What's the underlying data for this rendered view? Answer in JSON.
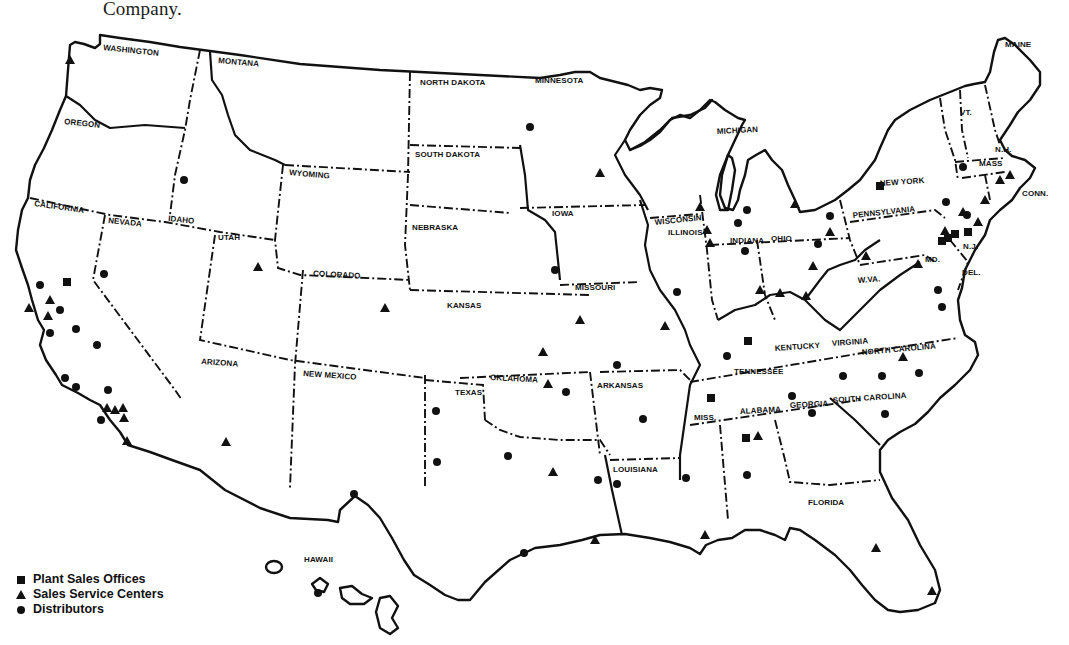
{
  "caption": {
    "text": "Company."
  },
  "map": {
    "state_labels": [
      {
        "name": "WASHINGTON",
        "x": 103,
        "y": 50,
        "r": 6
      },
      {
        "name": "MONTANA",
        "x": 218,
        "y": 63,
        "r": 5
      },
      {
        "name": "OREGON",
        "x": 64,
        "y": 124,
        "r": 6
      },
      {
        "name": "IDAHO",
        "x": 168,
        "y": 221,
        "r": 6
      },
      {
        "name": "WYOMING",
        "x": 289,
        "y": 175,
        "r": 5
      },
      {
        "name": "CALIFORNIA",
        "x": 34,
        "y": 206,
        "r": 8
      },
      {
        "name": "NEVADA",
        "x": 108,
        "y": 223,
        "r": 6
      },
      {
        "name": "UTAH",
        "x": 218,
        "y": 240,
        "r": 0
      },
      {
        "name": "COLORADO",
        "x": 313,
        "y": 276,
        "r": 3
      },
      {
        "name": "ARIZONA",
        "x": 201,
        "y": 364,
        "r": 4
      },
      {
        "name": "NEW MEXICO",
        "x": 303,
        "y": 376,
        "r": 4
      },
      {
        "name": "NORTH DAKOTA",
        "x": 420,
        "y": 85,
        "r": 0
      },
      {
        "name": "SOUTH DAKOTA",
        "x": 415,
        "y": 157,
        "r": 0
      },
      {
        "name": "NEBRASKA",
        "x": 412,
        "y": 230,
        "r": 0
      },
      {
        "name": "KANSAS",
        "x": 447,
        "y": 308,
        "r": 0
      },
      {
        "name": "OKLAHOMA",
        "x": 490,
        "y": 380,
        "r": 3
      },
      {
        "name": "TEXAS",
        "x": 455,
        "y": 395,
        "r": 0
      },
      {
        "name": "MINNESOTA",
        "x": 535,
        "y": 83,
        "r": 0
      },
      {
        "name": "IOWA",
        "x": 552,
        "y": 216,
        "r": 0
      },
      {
        "name": "MISSOURI",
        "x": 575,
        "y": 290,
        "r": 0
      },
      {
        "name": "ARKANSAS",
        "x": 597,
        "y": 388,
        "r": 0
      },
      {
        "name": "LOUISIANA",
        "x": 613,
        "y": 472,
        "r": 0
      },
      {
        "name": "WISCONSIN",
        "x": 655,
        "y": 225,
        "r": -6
      },
      {
        "name": "ILLINOIS",
        "x": 668,
        "y": 235,
        "r": 0
      },
      {
        "name": "MICHIGAN",
        "x": 717,
        "y": 134,
        "r": -3
      },
      {
        "name": "INDIANA",
        "x": 730,
        "y": 243,
        "r": 0
      },
      {
        "name": "OHIO",
        "x": 771,
        "y": 241,
        "r": 0
      },
      {
        "name": "KENTUCKY",
        "x": 775,
        "y": 351,
        "r": -4
      },
      {
        "name": "TENNESSEE",
        "x": 734,
        "y": 374,
        "r": 0
      },
      {
        "name": "MISS.",
        "x": 694,
        "y": 420,
        "r": 0
      },
      {
        "name": "ALABAMA",
        "x": 740,
        "y": 414,
        "r": -3
      },
      {
        "name": "GEORGIA",
        "x": 790,
        "y": 408,
        "r": -3
      },
      {
        "name": "FLORIDA",
        "x": 808,
        "y": 505,
        "r": 0
      },
      {
        "name": "SOUTH CAROLINA",
        "x": 833,
        "y": 403,
        "r": -4
      },
      {
        "name": "NORTH CAROLINA",
        "x": 862,
        "y": 355,
        "r": -5
      },
      {
        "name": "VIRGINIA",
        "x": 832,
        "y": 346,
        "r": -4
      },
      {
        "name": "W.VA.",
        "x": 858,
        "y": 283,
        "r": -4
      },
      {
        "name": "MD.",
        "x": 925,
        "y": 262,
        "r": 0
      },
      {
        "name": "DEL.",
        "x": 962,
        "y": 275,
        "r": 0
      },
      {
        "name": "N.J.",
        "x": 963,
        "y": 249,
        "r": 0
      },
      {
        "name": "PENNSYLVANIA",
        "x": 853,
        "y": 218,
        "r": -6
      },
      {
        "name": "NEW YORK",
        "x": 880,
        "y": 186,
        "r": -4
      },
      {
        "name": "CONN.",
        "x": 1022,
        "y": 196,
        "r": 0
      },
      {
        "name": "MASS",
        "x": 979,
        "y": 166,
        "r": 0
      },
      {
        "name": "N.H.",
        "x": 995,
        "y": 152,
        "r": 0
      },
      {
        "name": "VT.",
        "x": 960,
        "y": 115,
        "r": 0
      },
      {
        "name": "MAINE",
        "x": 1005,
        "y": 47,
        "r": 0
      },
      {
        "name": "HAWAII",
        "x": 304,
        "y": 562,
        "r": 0
      }
    ],
    "markers": {
      "plant_sales_offices": [
        [
          67,
          282
        ],
        [
          880,
          186
        ],
        [
          942,
          241
        ],
        [
          948,
          238
        ],
        [
          955,
          234
        ],
        [
          748,
          341
        ],
        [
          711,
          398
        ],
        [
          746,
          438
        ],
        [
          968,
          232
        ]
      ],
      "sales_service_centers": [
        [
          70,
          60
        ],
        [
          29,
          308
        ],
        [
          50,
          300
        ],
        [
          48,
          316
        ],
        [
          107,
          408
        ],
        [
          115,
          410
        ],
        [
          123,
          408
        ],
        [
          124,
          418
        ],
        [
          127,
          441
        ],
        [
          258,
          267
        ],
        [
          226,
          442
        ],
        [
          385,
          308
        ],
        [
          600,
          173
        ],
        [
          700,
          207
        ],
        [
          707,
          230
        ],
        [
          710,
          243
        ],
        [
          795,
          204
        ],
        [
          830,
          232
        ],
        [
          813,
          266
        ],
        [
          780,
          293
        ],
        [
          760,
          290
        ],
        [
          806,
          296
        ],
        [
          866,
          256
        ],
        [
          945,
          231
        ],
        [
          963,
          212
        ],
        [
          978,
          222
        ],
        [
          985,
          200
        ],
        [
          1000,
          180
        ],
        [
          1010,
          175
        ],
        [
          918,
          264
        ],
        [
          903,
          357
        ],
        [
          758,
          436
        ],
        [
          705,
          535
        ],
        [
          876,
          548
        ],
        [
          932,
          591
        ],
        [
          548,
          384
        ],
        [
          553,
          472
        ],
        [
          543,
          352
        ],
        [
          580,
          320
        ],
        [
          665,
          326
        ],
        [
          595,
          540
        ]
      ],
      "distributors": [
        [
          530,
          127
        ],
        [
          184,
          180
        ],
        [
          104,
          274
        ],
        [
          40,
          285
        ],
        [
          60,
          310
        ],
        [
          76,
          329
        ],
        [
          50,
          333
        ],
        [
          97,
          345
        ],
        [
          65,
          378
        ],
        [
          76,
          387
        ],
        [
          108,
          390
        ],
        [
          101,
          420
        ],
        [
          555,
          270
        ],
        [
          677,
          292
        ],
        [
          747,
          210
        ],
        [
          745,
          251
        ],
        [
          818,
          244
        ],
        [
          830,
          216
        ],
        [
          963,
          167
        ],
        [
          946,
          202
        ],
        [
          938,
          290
        ],
        [
          942,
          307
        ],
        [
          967,
          215
        ],
        [
          727,
          356
        ],
        [
          792,
          396
        ],
        [
          812,
          413
        ],
        [
          843,
          376
        ],
        [
          882,
          376
        ],
        [
          919,
          373
        ],
        [
          885,
          414
        ],
        [
          747,
          475
        ],
        [
          686,
          478
        ],
        [
          643,
          419
        ],
        [
          617,
          365
        ],
        [
          566,
          392
        ],
        [
          436,
          411
        ],
        [
          437,
          462
        ],
        [
          508,
          456
        ],
        [
          598,
          480
        ],
        [
          617,
          484
        ],
        [
          524,
          553
        ],
        [
          354,
          494
        ],
        [
          318,
          593
        ],
        [
          738,
          223
        ]
      ]
    }
  },
  "legend": {
    "items": [
      {
        "symbol": "square",
        "label": "Plant Sales Offices"
      },
      {
        "symbol": "triangle",
        "label": "Sales Service Centers"
      },
      {
        "symbol": "circle",
        "label": "Distributors"
      }
    ]
  }
}
